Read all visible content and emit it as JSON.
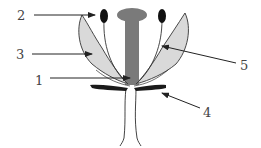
{
  "diagram": {
    "title": "",
    "labels": [
      {
        "id": "1",
        "text": "1",
        "part": "pistil base / ovary"
      },
      {
        "id": "2",
        "text": "2",
        "part": "anther"
      },
      {
        "id": "3",
        "text": "3",
        "part": "petal"
      },
      {
        "id": "4",
        "text": "4",
        "part": "sepal"
      },
      {
        "id": "5",
        "text": "5",
        "part": "stamen filament"
      }
    ],
    "colors": {
      "pistil": "#7a7a7a",
      "petal_fill": "#d9d9d9",
      "outline": "#333333",
      "anther": "#111111",
      "sepal": "#1a1a1a",
      "label_text": "#444444",
      "arrow": "#222222"
    }
  }
}
